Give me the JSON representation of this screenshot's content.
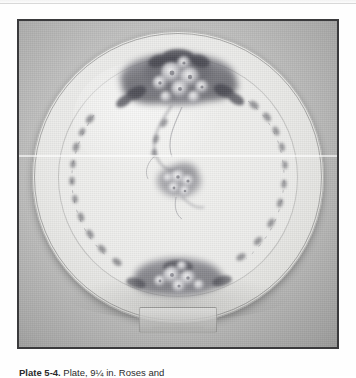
{
  "page": {
    "type": "book-page-scan",
    "background_color": "#fefefe"
  },
  "figure": {
    "frame_color": "#3a3a3c",
    "photo_background_color": "#bdbdbc",
    "color_mode": "black-and-white photograph",
    "plate": {
      "shape": "circular",
      "body_color": "#ebebe9",
      "rim_line_color": "#464646",
      "well_line_color": "#6e6e6e",
      "decoration": {
        "style": "hand-painted floral garland",
        "ink_color": "#55555a",
        "elements": [
          {
            "name": "top-floral-cluster",
            "position": "top-center",
            "size": "large"
          },
          {
            "name": "center-floral-spray",
            "position": "center",
            "size": "small"
          },
          {
            "name": "bottom-floral-cluster",
            "position": "bottom-center",
            "size": "medium"
          },
          {
            "name": "garland-trail-left",
            "position": "left-arc",
            "size": "trailing"
          },
          {
            "name": "garland-trail-right",
            "position": "right-arc",
            "size": "trailing"
          },
          {
            "name": "scroll-tendril",
            "position": "center-upper",
            "size": "curved"
          }
        ]
      }
    },
    "stand": {
      "name": "acrylic-plate-stand",
      "material": "clear acrylic",
      "position": "bottom-center"
    },
    "artifact": {
      "name": "scanner-line",
      "orientation": "horizontal",
      "color": "#ffffff"
    }
  },
  "caption": {
    "label": "Plate 5-4.",
    "text": "Plate, 9¼ in. Roses and"
  }
}
